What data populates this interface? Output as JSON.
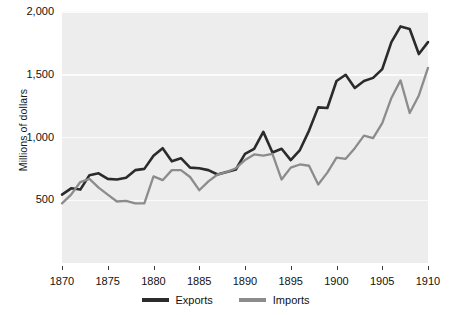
{
  "chart_data": {
    "type": "line",
    "title": "",
    "subtitle": "",
    "xlabel": "",
    "ylabel": "Millions of dollars",
    "xlim": [
      1870,
      1910
    ],
    "ylim": [
      0,
      2000
    ],
    "xticks": [
      1870,
      1875,
      1880,
      1885,
      1890,
      1895,
      1900,
      1905,
      1910
    ],
    "xtick_labels": [
      "1870",
      "1875",
      "1880",
      "1885",
      "1890",
      "1895",
      "1900",
      "1905",
      "1910"
    ],
    "yticks": [
      500,
      1000,
      1500,
      2000
    ],
    "ytick_labels": [
      "500",
      "1,000",
      "1,500",
      "2,000"
    ],
    "grid": "horizontal",
    "legend_position": "bottom-center",
    "x": [
      1870,
      1871,
      1872,
      1873,
      1874,
      1875,
      1876,
      1877,
      1878,
      1879,
      1880,
      1881,
      1882,
      1883,
      1884,
      1885,
      1886,
      1887,
      1888,
      1889,
      1890,
      1891,
      1892,
      1893,
      1894,
      1895,
      1896,
      1897,
      1898,
      1899,
      1900,
      1901,
      1902,
      1903,
      1904,
      1905,
      1906,
      1907,
      1908,
      1909,
      1910
    ],
    "series": [
      {
        "name": "Exports",
        "color": "#2b2b2b",
        "values": [
          545,
          595,
          585,
          700,
          715,
          670,
          665,
          680,
          740,
          750,
          855,
          915,
          810,
          835,
          760,
          755,
          740,
          705,
          725,
          745,
          870,
          910,
          1045,
          880,
          910,
          820,
          900,
          1055,
          1240,
          1235,
          1450,
          1500,
          1395,
          1450,
          1475,
          1545,
          1760,
          1885,
          1865,
          1665,
          1760
        ]
      },
      {
        "name": "Imports",
        "color": "#8c8c8c",
        "values": [
          475,
          545,
          645,
          670,
          600,
          545,
          490,
          495,
          475,
          475,
          690,
          660,
          740,
          740,
          685,
          580,
          650,
          705,
          725,
          755,
          820,
          865,
          855,
          870,
          665,
          760,
          785,
          775,
          625,
          720,
          840,
          830,
          915,
          1015,
          995,
          1115,
          1315,
          1455,
          1195,
          1335,
          1555
        ]
      }
    ]
  },
  "legend": {
    "entries": [
      {
        "label": "Exports"
      },
      {
        "label": "Imports"
      }
    ]
  }
}
